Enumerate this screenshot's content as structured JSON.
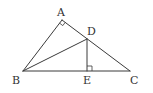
{
  "figure": {
    "points": {
      "A": {
        "label": "A"
      },
      "B": {
        "label": "B"
      },
      "C": {
        "label": "C"
      },
      "D": {
        "label": "D"
      },
      "E": {
        "label": "E"
      }
    },
    "segments": [
      {
        "name": "AB",
        "from": "A",
        "to": "B"
      },
      {
        "name": "AC",
        "from": "A",
        "to": "C"
      },
      {
        "name": "BC",
        "from": "B",
        "to": "C"
      },
      {
        "name": "BD",
        "from": "B",
        "to": "D"
      },
      {
        "name": "DE",
        "from": "D",
        "to": "E"
      }
    ],
    "right_angles": [
      {
        "at": "A",
        "between": [
          "AB",
          "AC"
        ]
      },
      {
        "at": "E",
        "between": [
          "DE",
          "EC"
        ]
      }
    ],
    "colors": {
      "line": "#3a3a3a",
      "text": "#333333",
      "background": "#ffffff"
    }
  }
}
